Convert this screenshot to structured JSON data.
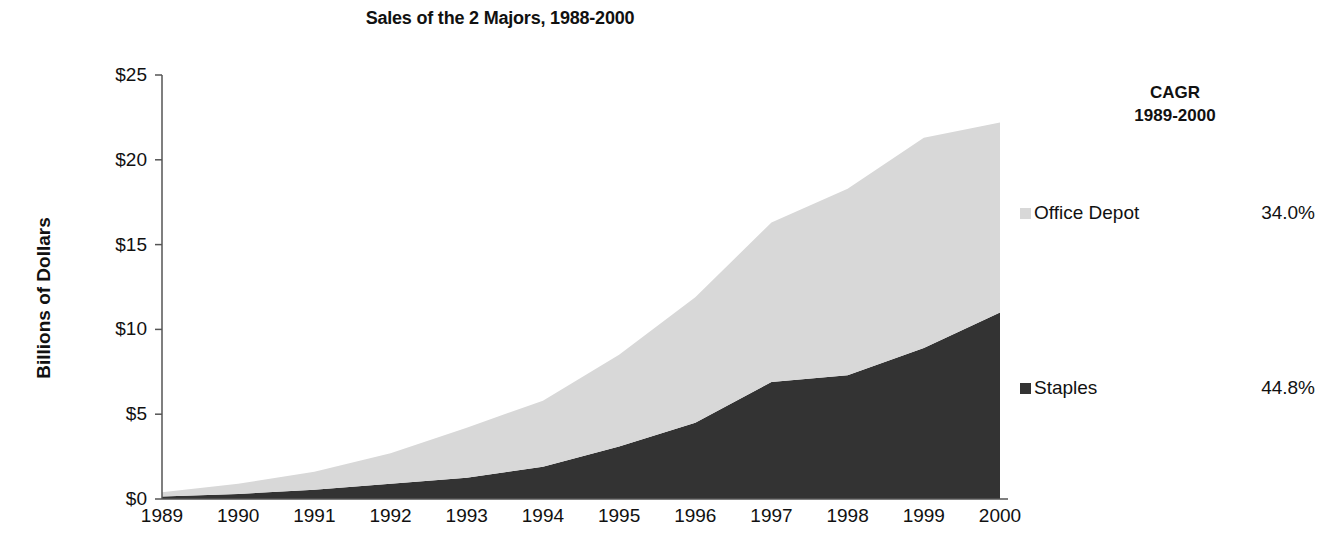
{
  "chart_data": {
    "type": "area",
    "stacked": true,
    "title": "Sales of the 2 Majors, 1988-2000",
    "xlabel": "",
    "ylabel": "Billions of Dollars",
    "categories": [
      "1989",
      "1990",
      "1991",
      "1992",
      "1993",
      "1994",
      "1995",
      "1996",
      "1997",
      "1998",
      "1999",
      "2000"
    ],
    "x": [
      1989,
      1990,
      1991,
      1992,
      1993,
      1994,
      1995,
      1996,
      1997,
      1998,
      1999,
      2000
    ],
    "ylim": [
      0,
      25
    ],
    "ytick_labels": [
      "$0",
      "$5",
      "$10",
      "$15",
      "$20",
      "$25"
    ],
    "ytick_values": [
      0,
      5,
      10,
      15,
      20,
      25
    ],
    "grid": false,
    "legend_position": "right",
    "series": [
      {
        "name": "Staples",
        "color": "#333333",
        "cagr": "44.8%",
        "values": [
          0.15,
          0.3,
          0.55,
          0.9,
          1.25,
          1.9,
          3.1,
          4.5,
          6.9,
          7.3,
          8.9,
          11.0
        ]
      },
      {
        "name": "Office Depot",
        "color": "#d8d8d8",
        "cagr": "34.0%",
        "values": [
          0.25,
          0.6,
          1.05,
          1.8,
          2.95,
          3.9,
          5.4,
          7.4,
          9.4,
          11.0,
          12.4,
          11.2
        ]
      }
    ],
    "totals": [
      0.4,
      0.9,
      1.6,
      2.7,
      4.2,
      5.8,
      8.5,
      11.9,
      16.3,
      18.3,
      21.3,
      22.2
    ],
    "cagr_header_line1": "CAGR",
    "cagr_header_line2": "1989-2000"
  },
  "legend": [
    {
      "label": "Office Depot",
      "value": "34.0%"
    },
    {
      "label": "Staples",
      "value": "44.8%"
    }
  ]
}
